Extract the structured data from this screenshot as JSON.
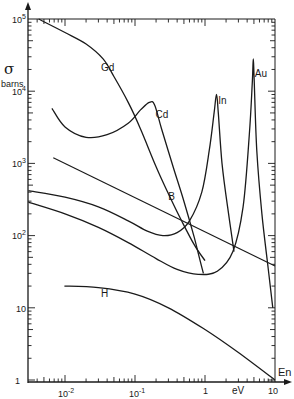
{
  "chart_data": {
    "type": "line",
    "title": "",
    "xlabel": "eV",
    "xaxis_symbol": "En",
    "ylabel": "σ barns",
    "ylabel_symbol": "σ",
    "ylabel_unit": "barns",
    "xscale": "log",
    "yscale": "log",
    "xlim": [
      0.003,
      10
    ],
    "ylim": [
      1,
      100000
    ],
    "grid": false,
    "legend": "inline labels",
    "x_ticks": [
      {
        "value": 0.01,
        "label": "10",
        "exp": "-2"
      },
      {
        "value": 0.1,
        "label": "10",
        "exp": "-1"
      },
      {
        "value": 1,
        "label": "1",
        "exp": ""
      },
      {
        "value": 10,
        "label": "10",
        "exp": ""
      }
    ],
    "y_ticks": [
      {
        "value": 1,
        "label": "1",
        "exp": ""
      },
      {
        "value": 10,
        "label": "10",
        "exp": ""
      },
      {
        "value": 100,
        "label": "10",
        "exp": "2"
      },
      {
        "value": 1000,
        "label": "10",
        "exp": "3"
      },
      {
        "value": 10000,
        "label": "10",
        "exp": "4"
      },
      {
        "value": 100000,
        "label": "10",
        "exp": "5"
      }
    ],
    "series": [
      {
        "name": "Gd",
        "label_pos": [
          0.035,
          20000
        ],
        "points": [
          [
            0.0042,
            100000
          ],
          [
            0.01,
            65000
          ],
          [
            0.02,
            45000
          ],
          [
            0.035,
            28000
          ],
          [
            0.05,
            16000
          ],
          [
            0.08,
            7000
          ],
          [
            0.12,
            3000
          ],
          [
            0.2,
            900
          ],
          [
            0.3,
            380
          ],
          [
            0.45,
            170
          ],
          [
            0.7,
            75
          ],
          [
            1.0,
            45
          ]
        ]
      },
      {
        "name": "Cd",
        "label_pos": [
          0.21,
          4500
        ],
        "points": [
          [
            0.0065,
            5800
          ],
          [
            0.01,
            3200
          ],
          [
            0.02,
            2300
          ],
          [
            0.04,
            2500
          ],
          [
            0.08,
            3600
          ],
          [
            0.12,
            5500
          ],
          [
            0.16,
            7000
          ],
          [
            0.19,
            6500
          ],
          [
            0.24,
            3000
          ],
          [
            0.35,
            900
          ],
          [
            0.5,
            300
          ],
          [
            0.7,
            95
          ],
          [
            0.85,
            45
          ],
          [
            0.95,
            30
          ]
        ]
      },
      {
        "name": "In",
        "label_pos": [
          1.65,
          7000
        ],
        "points": [
          [
            0.003,
            420
          ],
          [
            0.01,
            340
          ],
          [
            0.03,
            250
          ],
          [
            0.08,
            160
          ],
          [
            0.15,
            115
          ],
          [
            0.25,
            100
          ],
          [
            0.4,
            110
          ],
          [
            0.6,
            160
          ],
          [
            0.9,
            400
          ],
          [
            1.15,
            1500
          ],
          [
            1.35,
            5000
          ],
          [
            1.46,
            9000
          ],
          [
            1.55,
            5000
          ],
          [
            1.75,
            1000
          ],
          [
            2.1,
            250
          ],
          [
            2.6,
            60
          ]
        ]
      },
      {
        "name": "Au",
        "label_pos": [
          5.5,
          17000
        ],
        "points": [
          [
            0.003,
            290
          ],
          [
            0.01,
            200
          ],
          [
            0.03,
            130
          ],
          [
            0.08,
            80
          ],
          [
            0.2,
            48
          ],
          [
            0.4,
            34
          ],
          [
            0.8,
            29
          ],
          [
            1.5,
            32
          ],
          [
            2.5,
            60
          ],
          [
            3.5,
            250
          ],
          [
            4.3,
            2500
          ],
          [
            4.75,
            14000
          ],
          [
            4.9,
            28000
          ],
          [
            5.05,
            14000
          ],
          [
            5.5,
            1500
          ],
          [
            6.5,
            200
          ],
          [
            8,
            35
          ],
          [
            9.3,
            10
          ]
        ]
      },
      {
        "name": "B",
        "label_pos": [
          0.32,
          330
        ],
        "points": [
          [
            0.0068,
            1200
          ],
          [
            10,
            38
          ]
        ]
      },
      {
        "name": "H",
        "label_pos": [
          0.035,
          15
        ],
        "points": [
          [
            0.0098,
            20
          ],
          [
            0.03,
            19
          ],
          [
            0.1,
            15.5
          ],
          [
            0.3,
            10
          ],
          [
            1,
            5
          ],
          [
            3,
            2.4
          ],
          [
            10,
            1
          ]
        ]
      }
    ]
  }
}
